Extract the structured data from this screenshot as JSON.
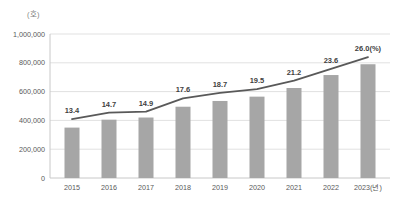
{
  "chart_data": {
    "type": "bar",
    "title": "",
    "unit_label": "(호)",
    "xlabel": "",
    "ylabel": "",
    "categories": [
      "2015",
      "2016",
      "2017",
      "2018",
      "2019",
      "2020",
      "2021",
      "2022",
      "2023(년)"
    ],
    "series": [
      {
        "name": "count-bars",
        "type": "bar",
        "values": [
          350000,
          405000,
          420000,
          495000,
          535000,
          565000,
          625000,
          715000,
          790000
        ]
      },
      {
        "name": "share-percent-line",
        "type": "line",
        "values": [
          13.4,
          14.7,
          14.9,
          17.6,
          18.7,
          19.5,
          21.2,
          23.6,
          26.0
        ],
        "point_labels": [
          "13.4",
          "14.7",
          "14.9",
          "17.6",
          "18.7",
          "19.5",
          "21.2",
          "23.6",
          "26.0(%)"
        ]
      }
    ],
    "ylim": [
      0,
      1000000
    ],
    "ytick_values": [
      0,
      200000,
      400000,
      600000,
      800000,
      1000000
    ],
    "ytick_labels": [
      "0",
      "200,000",
      "400,000",
      "600,000",
      "800,000",
      "1,000,000"
    ],
    "secondary_ylim": [
      1.4,
      30.7
    ],
    "grid": "horizontal",
    "legend": "none",
    "colors": {
      "bar": "#a6a6a6",
      "line": "#595959",
      "grid": "#e1e1e1",
      "axis": "#c8c8c8",
      "tick_text": "#595959",
      "label_text": "#3f3f3f"
    }
  }
}
